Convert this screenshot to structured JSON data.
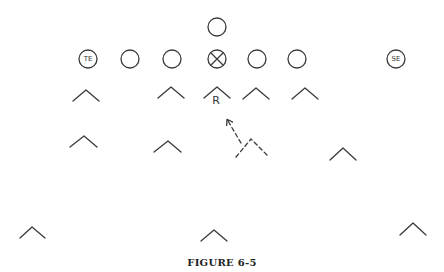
{
  "figure": {
    "caption": "FIGURE 6-5",
    "offense": {
      "backfield": [
        {
          "id": "back",
          "label": ""
        }
      ],
      "line": [
        {
          "id": "te",
          "label": "TE"
        },
        {
          "id": "lt",
          "label": ""
        },
        {
          "id": "lg",
          "label": ""
        },
        {
          "id": "center",
          "label": "",
          "marked": true
        },
        {
          "id": "rg",
          "label": ""
        },
        {
          "id": "rt",
          "label": ""
        },
        {
          "id": "se",
          "label": "SE"
        }
      ]
    },
    "defense": {
      "first_level": [
        {
          "id": "d1",
          "label": ""
        },
        {
          "id": "d2",
          "label": ""
        },
        {
          "id": "rover",
          "label": "R"
        },
        {
          "id": "d4",
          "label": ""
        },
        {
          "id": "d5",
          "label": ""
        }
      ],
      "second_level": [
        {
          "id": "lb1",
          "label": ""
        },
        {
          "id": "lb2",
          "label": ""
        },
        {
          "id": "lb3-dashed",
          "label": "",
          "dashed": true,
          "movement": "drops back diagonally toward the line of scrimmage (arrow)"
        },
        {
          "id": "lb4",
          "label": ""
        }
      ],
      "deep": [
        {
          "id": "cb-left",
          "label": ""
        },
        {
          "id": "safety",
          "label": ""
        },
        {
          "id": "cb-right",
          "label": ""
        }
      ]
    }
  }
}
